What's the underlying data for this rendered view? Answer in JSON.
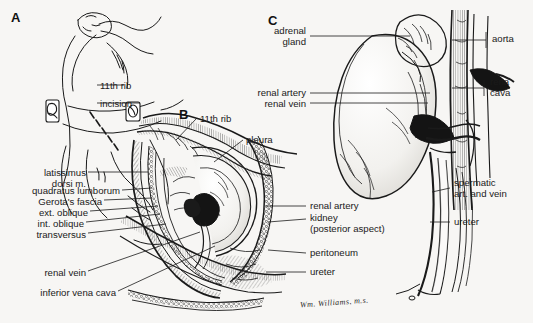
{
  "figure": {
    "background_color": "#f7f6f4",
    "ink_color": "#1a1a1a",
    "signature": "Wm. Williams, m.s."
  },
  "panels": [
    {
      "id": "A",
      "letter": "A",
      "caption": "Patient in lateral decubitus position with dashed incision line over the eleventh rib",
      "labels": [
        {
          "text": "11th rib",
          "align": "left"
        },
        {
          "text": "incision",
          "align": "left"
        }
      ]
    },
    {
      "id": "B",
      "letter": "B",
      "caption": "Cross-sectional view of the flank exposure showing muscle layers and posterior kidney",
      "labels_left": [
        {
          "text": "latissimus\n   dorsi m."
        },
        {
          "text": "quadratus lumborum"
        },
        {
          "text": "Gerota's fascia"
        },
        {
          "text": "ext. oblique"
        },
        {
          "text": "int. oblique"
        },
        {
          "text": "transversus"
        },
        {
          "text": "renal vein"
        },
        {
          "text": "inferior vena cava"
        }
      ],
      "labels_top": [
        {
          "text": "11th rib"
        },
        {
          "text": "pleura"
        }
      ],
      "labels_right": [
        {
          "text": "renal artery"
        },
        {
          "text": "kidney\n(posterior aspect)"
        },
        {
          "text": "peritoneum"
        },
        {
          "text": "ureter"
        }
      ]
    },
    {
      "id": "C",
      "letter": "C",
      "caption": "Anterior view of the kidney with adrenal gland, great vessels, and ureter",
      "labels_left": [
        {
          "text": "adrenal\n  gland"
        },
        {
          "text": "renal artery"
        },
        {
          "text": "renal vein"
        }
      ],
      "labels_right": [
        {
          "text": "aorta"
        },
        {
          "text": "rena\ncava"
        },
        {
          "text": "spermatic\nart. and vein"
        },
        {
          "text": "ureter"
        }
      ]
    }
  ]
}
